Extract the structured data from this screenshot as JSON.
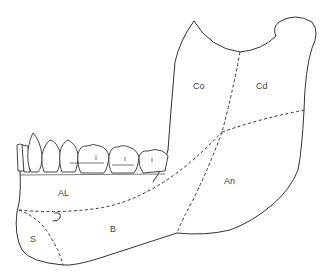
{
  "caption_fragment": "",
  "figure": {
    "regions": [
      {
        "id": "co",
        "label": "Co",
        "x": 193,
        "y": 89
      },
      {
        "id": "cd",
        "label": "Cd",
        "x": 256,
        "y": 89
      },
      {
        "id": "an",
        "label": "An",
        "x": 224,
        "y": 184
      },
      {
        "id": "al",
        "label": "AL",
        "x": 58,
        "y": 196
      },
      {
        "id": "b",
        "label": "B",
        "x": 113,
        "y": 232
      },
      {
        "id": "s",
        "label": "S",
        "x": 33,
        "y": 242
      }
    ],
    "colors": {
      "line": "#333333",
      "label": "#444444",
      "background": "#ffffff"
    }
  }
}
